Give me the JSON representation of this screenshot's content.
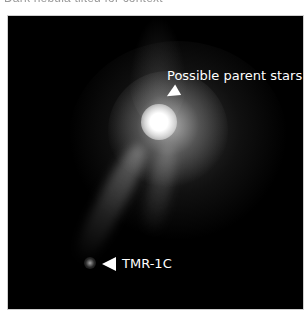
{
  "caption": {
    "clipped_text": "Dark nebula tilted for context"
  },
  "figure": {
    "background_color": "#000000",
    "annotations": [
      {
        "label": "Possible parent stars",
        "arrow_direction": "down-left"
      },
      {
        "label": "TMR-1C",
        "arrow_direction": "left"
      }
    ]
  }
}
